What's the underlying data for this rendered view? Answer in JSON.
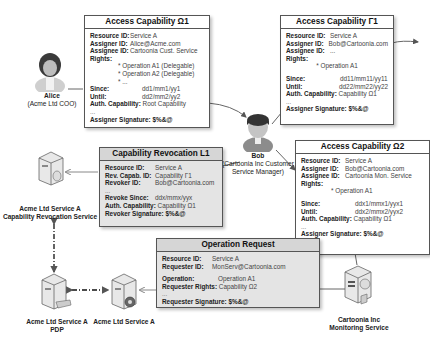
{
  "actors": {
    "alice": {
      "name": "Alice",
      "role": "(Acme Ltd COO)"
    },
    "bob": {
      "name": "Bob",
      "role_line1": "(Cartoonia Inc Customer",
      "role_line2": "Service Manager)"
    }
  },
  "services": {
    "revocation": {
      "line1": "Acme Ltd Service A",
      "line2": "Capability Revocation Service"
    },
    "pdp": {
      "line1": "Acme Ltd Service A",
      "line2": "PDP"
    },
    "service_a": {
      "line1": "Acme Ltd Service A"
    },
    "monitoring": {
      "line1": "Cartoonia Inc",
      "line2": "Monitoring Service"
    }
  },
  "cap_omega1": {
    "title": "Access Capability Ω1",
    "resource_label": "Resource ID:",
    "resource": "Service A",
    "assigner_label": "Assigner ID:",
    "assigner": "Alice@Acme.com",
    "assignee_label": "Assignee ID:",
    "assignee": "Cartoonia Cust. Service",
    "rights_label": "Rights:",
    "rights": [
      "* Operation A1 (Delegable)",
      "* Operation A2 (Delegable)",
      "* ..."
    ],
    "since_label": "Since:",
    "since": "dd1/mm1/yy1",
    "until_label": "Until:",
    "until": "dd2/mm2/yy2",
    "auth_label": "Auth. Capability:",
    "auth": "Root Capability",
    "ellipsis": "...",
    "sig_label": "Assigner Signature:",
    "sig": "$%&@"
  },
  "cap_gamma1": {
    "title": "Access Capability Γ1",
    "resource_label": "Resource ID:",
    "resource": "Service A",
    "assigner_label": "Assigner ID:",
    "assigner": "Bob@Cartoonia.com",
    "assignee_label": "Assignee ID:",
    "assignee": "...",
    "rights_label": "Rights:",
    "rights": [
      "* Operation A1"
    ],
    "since_label": "Since:",
    "since": "dd11/mm11/yy11",
    "until_label": "Until:",
    "until": "dd22/mm22/yy22",
    "auth_label": "Auth. Capability:",
    "auth": "Capability Ω1",
    "ellipsis": "...",
    "sig_label": "Assigner Signature:",
    "sig": "$%&@"
  },
  "revocation_l1": {
    "title": "Capability Revocation L1",
    "resource_label": "Resource ID:",
    "resource": "Service A",
    "revcap_label": "Rev. Capab. ID:",
    "revcap": "Capability Γ1",
    "revoker_label": "Revoker ID:",
    "revoker": "Bob@Cartoonia.com",
    "ellipsis": "...",
    "since_label": "Revoke Since:",
    "since": "ddx/mmx/yyx",
    "auth_label": "Auth. Capability:",
    "auth": "Capability Ω1",
    "sig_label": "Revoker Signature:",
    "sig": "$%&@"
  },
  "cap_omega2": {
    "title": "Access Capability Ω2",
    "resource_label": "Resource ID:",
    "resource": "Service A",
    "assigner_label": "Assigner ID:",
    "assigner": "Bob@Cartoonia.com",
    "assignee_label": "Assignee ID:",
    "assignee": "Cartoonia Mon. Service",
    "rights_label": "Rights:",
    "rights": [
      "* Operation A1"
    ],
    "since_label": "Since:",
    "since": "ddx1/mmx1/yyx1",
    "until_label": "Until:",
    "until": "ddx2/mmx2/yyx2",
    "auth_label": "Auth. Capability:",
    "auth": "Capability Ω1",
    "ellipsis": "...",
    "sig_label": "Assigner Signature:",
    "sig": "$%&@"
  },
  "op_request": {
    "title": "Operation Request",
    "resource_label": "Resource ID:",
    "resource": "Service A",
    "requester_label": "Requester ID:",
    "requester": "MonServ@Cartoonia.com",
    "operation_label": "Operation:",
    "operation": "Operation A1",
    "rights_label": "Requester Rights:",
    "rights": "Capability Ω2",
    "ellipsis": "...",
    "sig_label": "Requester Signature:",
    "sig": "$%&@"
  },
  "colors": {
    "border": "#555555",
    "grey_box": "#e4e4e4",
    "arrow": "#666666"
  }
}
